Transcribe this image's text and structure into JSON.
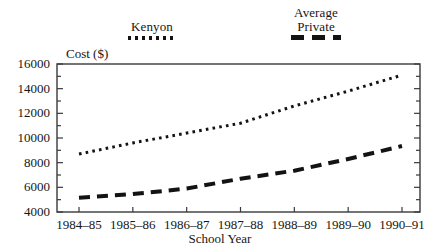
{
  "chart_data": {
    "type": "line",
    "title": "",
    "xlabel": "School Year",
    "ylabel": "Cost ($)",
    "categories": [
      "1984–85",
      "1985–86",
      "1986–87",
      "1987–88",
      "1988–89",
      "1989–90",
      "1990–91"
    ],
    "series": [
      {
        "name": "Kenyon",
        "style": "dotted",
        "color": "#131313",
        "values": [
          8700,
          9600,
          10400,
          11200,
          12600,
          13800,
          15100
        ]
      },
      {
        "name": "Average Private",
        "style": "dashed",
        "color": "#131313",
        "values": [
          5150,
          5450,
          5900,
          6700,
          7350,
          8300,
          9350
        ]
      }
    ],
    "ylim": [
      4000,
      16000
    ],
    "ytick_values": [
      4000,
      6000,
      8000,
      10000,
      12000,
      14000,
      16000
    ],
    "ytick_labels": [
      "4000",
      "6000",
      "8000",
      "10000",
      "12000",
      "14000",
      "16000"
    ],
    "yminor_step": 1000,
    "grid": false,
    "legend_position": "top"
  },
  "legend": {
    "entries": [
      {
        "label": "Kenyon",
        "swatch": "dotted-line-swatch"
      },
      {
        "label": "Average\nPrivate",
        "swatch": "dashed-line-swatch"
      }
    ]
  },
  "axes": {
    "y_title": "Cost ($)",
    "x_title": "School Year"
  }
}
